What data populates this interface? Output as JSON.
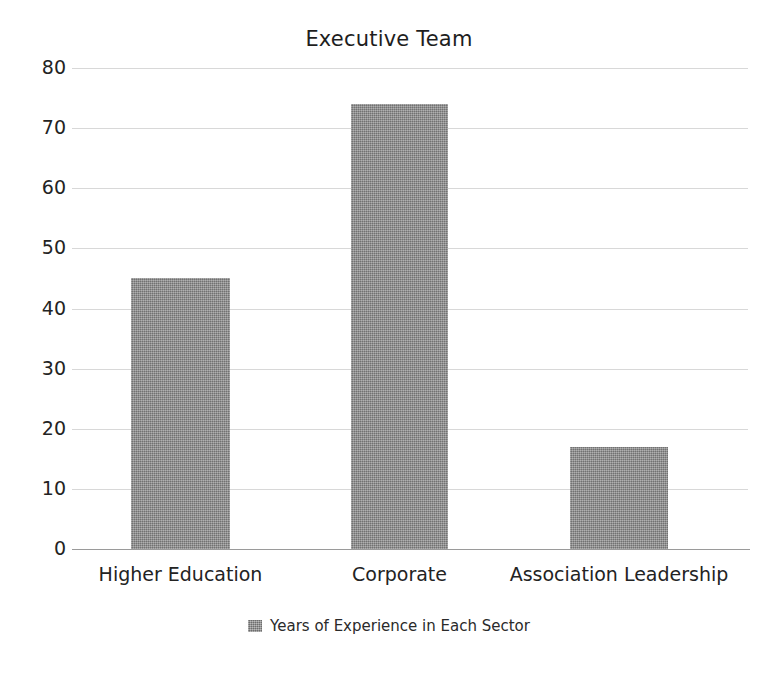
{
  "chart_data": {
    "type": "bar",
    "title": "Executive Team",
    "xlabel": "",
    "ylabel": "",
    "categories": [
      "Higher Education",
      "Corporate",
      "Association Leadership"
    ],
    "values": [
      45,
      74,
      17
    ],
    "series": [
      {
        "name": "Years of Experience in Each Sector",
        "values": [
          45,
          74,
          17
        ],
        "color": "#8d8d8d"
      }
    ],
    "ylim": [
      0,
      80
    ],
    "y_ticks": [
      80,
      70,
      60,
      50,
      40,
      30,
      20,
      10,
      0
    ],
    "y_tick_labels": [
      "80",
      "70",
      "60",
      "50",
      "40",
      "30",
      "20",
      "10",
      "0"
    ],
    "grid": true,
    "grid_axis": "y",
    "legend": {
      "position": "bottom",
      "entries": [
        {
          "label": "Years of Experience in Each Sector",
          "color": "#8d8d8d"
        }
      ]
    },
    "colors": {
      "bar": "#8d8d8d",
      "gridline": "#d8d8d8",
      "axis": "#9a9a9a",
      "text": "#232323",
      "background": "#ffffff"
    }
  }
}
